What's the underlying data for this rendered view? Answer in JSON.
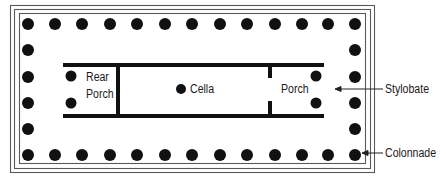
{
  "diagram": {
    "colors": {
      "ink": "#111111",
      "border": "#555555",
      "background": "#ffffff"
    },
    "labels": {
      "rear_porch_line1": "Rear",
      "rear_porch_line2": "Porch",
      "cella": "Cella",
      "porch": "Porch",
      "stylobate": "Stylobate",
      "colonnade": "Colonnade"
    },
    "colonnade": {
      "top_row_count": 14,
      "bottom_row_count": 14,
      "side_column_count": 6
    },
    "inner_columns": {
      "rear_porch": 2,
      "front_porch": 2,
      "cella": 1
    }
  }
}
